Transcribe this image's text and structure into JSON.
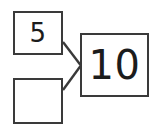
{
  "diagram": {
    "type": "part-part-whole",
    "background_color": "#ffffff",
    "line_color": "#3a3a3a",
    "text_color": "#1c1c1c",
    "parts": [
      {
        "id": "part-a",
        "label": "5",
        "filled": true
      },
      {
        "id": "part-b",
        "label": "",
        "filled": false
      }
    ],
    "whole": {
      "id": "whole",
      "label": "10"
    },
    "connectors": [
      {
        "id": "connector-top",
        "from": "part-a",
        "to": "whole",
        "x1": 63,
        "y1": 42,
        "x2": 80,
        "y2": 65
      },
      {
        "id": "connector-bottom",
        "from": "part-b",
        "to": "whole",
        "x1": 63,
        "y1": 90,
        "x2": 80,
        "y2": 66
      }
    ]
  }
}
